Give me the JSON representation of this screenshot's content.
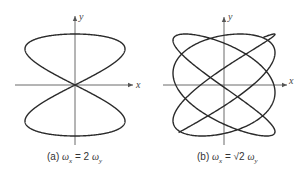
{
  "figures": [
    {
      "id": "a",
      "caption_prefix": "(a)",
      "caption_lhs": "ω",
      "caption_lhs_sub": "x",
      "caption_eq": " = ",
      "caption_coef": "2",
      "caption_rhs": "ω",
      "caption_rhs_sub": "y",
      "x_axis_label": "x",
      "y_axis_label": "y",
      "center": [
        75,
        85
      ],
      "amplitude": [
        50,
        51
      ],
      "freq_ratio_x_over_y": 2,
      "phase": 0,
      "t_range": [
        0,
        6.2832
      ],
      "axis": {
        "x_from": 15,
        "x_to": 133,
        "y_from": 145,
        "y_to": 16
      }
    },
    {
      "id": "b",
      "caption_prefix": "(b)",
      "caption_lhs": "ω",
      "caption_lhs_sub": "x",
      "caption_eq": " = ",
      "caption_coef": "√2",
      "caption_rhs": "ω",
      "caption_rhs_sub": "y",
      "x_axis_label": "x",
      "y_axis_label": "y",
      "center": [
        224,
        85
      ],
      "amplitude": [
        51,
        51
      ],
      "freq_ratio_x_over_y": 1.41421,
      "phase": 0.6,
      "t_range": [
        -1.2,
        14.5
      ],
      "axis": {
        "x_from": 163,
        "x_to": 287,
        "y_from": 145,
        "y_to": 17
      }
    }
  ],
  "chart_data": [
    {
      "type": "line",
      "title": "(a) ωx = 2 ωy",
      "xlabel": "x",
      "ylabel": "y",
      "description": "Lissajous figure-eight, x = A sin(2t), y = B sin(t)",
      "grid": false
    },
    {
      "type": "line",
      "title": "(b) ωx = √2 ωy",
      "xlabel": "x",
      "ylabel": "y",
      "description": "Non-closing Lissajous curve, x = A sin(√2 t + φ), y = B sin(t)",
      "grid": false
    }
  ]
}
